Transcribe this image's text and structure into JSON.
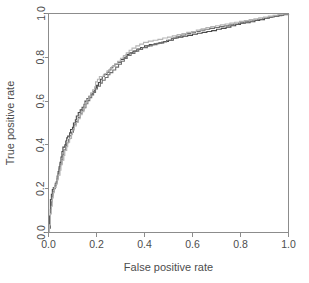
{
  "chart_data": {
    "type": "line",
    "title": "",
    "subtitle": "",
    "xlabel": "False positive rate",
    "ylabel": "True positive rate",
    "xlim": [
      0,
      1
    ],
    "ylim": [
      0,
      1
    ],
    "xticks": [
      "0.0",
      "0.2",
      "0.4",
      "0.6",
      "0.8",
      "1.0"
    ],
    "yticks": [
      "0.0",
      "0.2",
      "0.4",
      "0.6",
      "0.8",
      "1.0"
    ],
    "xtick_values": [
      0.0,
      0.2,
      0.4,
      0.6,
      0.8,
      1.0
    ],
    "ytick_values": [
      0.0,
      0.2,
      0.4,
      0.6,
      0.8,
      1.0
    ],
    "grid": false,
    "legend": "none",
    "legend_position": "none",
    "plot_style": "step",
    "colors": {
      "curve_dark": "#4a4a4a",
      "curve_medium": "#6e6e6e",
      "curve_light": "#b4b4b4",
      "axis": "#8c8c8c",
      "text": "#4d4d4d",
      "background": "#ffffff"
    },
    "series": [
      {
        "name": "curve-1",
        "color": "#4a4a4a",
        "points": [
          [
            0.0,
            0.0
          ],
          [
            0.004,
            0.03
          ],
          [
            0.004,
            0.075
          ],
          [
            0.008,
            0.11
          ],
          [
            0.008,
            0.15
          ],
          [
            0.012,
            0.175
          ],
          [
            0.016,
            0.196
          ],
          [
            0.02,
            0.205
          ],
          [
            0.028,
            0.215
          ],
          [
            0.032,
            0.232
          ],
          [
            0.036,
            0.258
          ],
          [
            0.04,
            0.278
          ],
          [
            0.044,
            0.3
          ],
          [
            0.048,
            0.32
          ],
          [
            0.052,
            0.345
          ],
          [
            0.056,
            0.37
          ],
          [
            0.06,
            0.39
          ],
          [
            0.068,
            0.4
          ],
          [
            0.072,
            0.418
          ],
          [
            0.076,
            0.432
          ],
          [
            0.08,
            0.44
          ],
          [
            0.088,
            0.455
          ],
          [
            0.092,
            0.47
          ],
          [
            0.1,
            0.48
          ],
          [
            0.104,
            0.5
          ],
          [
            0.112,
            0.515
          ],
          [
            0.116,
            0.532
          ],
          [
            0.124,
            0.548
          ],
          [
            0.132,
            0.56
          ],
          [
            0.14,
            0.572
          ],
          [
            0.148,
            0.585
          ],
          [
            0.152,
            0.6
          ],
          [
            0.16,
            0.612
          ],
          [
            0.168,
            0.622
          ],
          [
            0.176,
            0.632
          ],
          [
            0.184,
            0.645
          ],
          [
            0.192,
            0.66
          ],
          [
            0.2,
            0.672
          ],
          [
            0.208,
            0.685
          ],
          [
            0.216,
            0.7
          ],
          [
            0.224,
            0.712
          ],
          [
            0.232,
            0.722
          ],
          [
            0.244,
            0.732
          ],
          [
            0.252,
            0.742
          ],
          [
            0.26,
            0.752
          ],
          [
            0.268,
            0.76
          ],
          [
            0.276,
            0.768
          ],
          [
            0.288,
            0.778
          ],
          [
            0.3,
            0.79
          ],
          [
            0.312,
            0.8
          ],
          [
            0.324,
            0.812
          ],
          [
            0.336,
            0.82
          ],
          [
            0.352,
            0.828
          ],
          [
            0.368,
            0.838
          ],
          [
            0.384,
            0.845
          ],
          [
            0.4,
            0.852
          ],
          [
            0.42,
            0.858
          ],
          [
            0.44,
            0.862
          ],
          [
            0.46,
            0.866
          ],
          [
            0.48,
            0.872
          ],
          [
            0.5,
            0.878
          ],
          [
            0.52,
            0.888
          ],
          [
            0.54,
            0.892
          ],
          [
            0.56,
            0.896
          ],
          [
            0.58,
            0.9
          ],
          [
            0.6,
            0.905
          ],
          [
            0.62,
            0.91
          ],
          [
            0.64,
            0.914
          ],
          [
            0.66,
            0.918
          ],
          [
            0.68,
            0.922
          ],
          [
            0.7,
            0.928
          ],
          [
            0.72,
            0.932
          ],
          [
            0.74,
            0.938
          ],
          [
            0.76,
            0.944
          ],
          [
            0.78,
            0.95
          ],
          [
            0.8,
            0.956
          ],
          [
            0.82,
            0.958
          ],
          [
            0.84,
            0.962
          ],
          [
            0.86,
            0.968
          ],
          [
            0.88,
            0.972
          ],
          [
            0.9,
            0.978
          ],
          [
            0.92,
            0.984
          ],
          [
            0.94,
            0.988
          ],
          [
            0.96,
            0.992
          ],
          [
            0.98,
            0.996
          ],
          [
            1.0,
            1.0
          ]
        ]
      },
      {
        "name": "curve-2",
        "color": "#6e6e6e",
        "points": [
          [
            0.0,
            0.0
          ],
          [
            0.004,
            0.02
          ],
          [
            0.008,
            0.06
          ],
          [
            0.008,
            0.105
          ],
          [
            0.012,
            0.14
          ],
          [
            0.016,
            0.168
          ],
          [
            0.02,
            0.186
          ],
          [
            0.024,
            0.2
          ],
          [
            0.028,
            0.225
          ],
          [
            0.036,
            0.245
          ],
          [
            0.04,
            0.268
          ],
          [
            0.044,
            0.29
          ],
          [
            0.048,
            0.312
          ],
          [
            0.056,
            0.332
          ],
          [
            0.06,
            0.355
          ],
          [
            0.064,
            0.378
          ],
          [
            0.072,
            0.396
          ],
          [
            0.076,
            0.41
          ],
          [
            0.084,
            0.425
          ],
          [
            0.088,
            0.442
          ],
          [
            0.096,
            0.458
          ],
          [
            0.104,
            0.472
          ],
          [
            0.108,
            0.492
          ],
          [
            0.116,
            0.508
          ],
          [
            0.124,
            0.525
          ],
          [
            0.132,
            0.542
          ],
          [
            0.14,
            0.558
          ],
          [
            0.148,
            0.57
          ],
          [
            0.156,
            0.588
          ],
          [
            0.164,
            0.602
          ],
          [
            0.172,
            0.616
          ],
          [
            0.18,
            0.628
          ],
          [
            0.188,
            0.64
          ],
          [
            0.196,
            0.655
          ],
          [
            0.204,
            0.668
          ],
          [
            0.216,
            0.682
          ],
          [
            0.224,
            0.695
          ],
          [
            0.236,
            0.708
          ],
          [
            0.248,
            0.72
          ],
          [
            0.256,
            0.73
          ],
          [
            0.268,
            0.742
          ],
          [
            0.28,
            0.755
          ],
          [
            0.292,
            0.768
          ],
          [
            0.304,
            0.782
          ],
          [
            0.316,
            0.795
          ],
          [
            0.328,
            0.808
          ],
          [
            0.344,
            0.818
          ],
          [
            0.36,
            0.828
          ],
          [
            0.376,
            0.836
          ],
          [
            0.392,
            0.844
          ],
          [
            0.412,
            0.852
          ],
          [
            0.432,
            0.858
          ],
          [
            0.452,
            0.864
          ],
          [
            0.472,
            0.87
          ],
          [
            0.492,
            0.878
          ],
          [
            0.512,
            0.886
          ],
          [
            0.532,
            0.896
          ],
          [
            0.552,
            0.902
          ],
          [
            0.572,
            0.908
          ],
          [
            0.592,
            0.912
          ],
          [
            0.612,
            0.918
          ],
          [
            0.632,
            0.924
          ],
          [
            0.652,
            0.928
          ],
          [
            0.672,
            0.932
          ],
          [
            0.692,
            0.936
          ],
          [
            0.712,
            0.94
          ],
          [
            0.732,
            0.944
          ],
          [
            0.752,
            0.948
          ],
          [
            0.772,
            0.952
          ],
          [
            0.792,
            0.956
          ],
          [
            0.812,
            0.962
          ],
          [
            0.832,
            0.966
          ],
          [
            0.852,
            0.97
          ],
          [
            0.872,
            0.974
          ],
          [
            0.892,
            0.978
          ],
          [
            0.912,
            0.982
          ],
          [
            0.932,
            0.986
          ],
          [
            0.952,
            0.99
          ],
          [
            0.972,
            0.994
          ],
          [
            1.0,
            1.0
          ]
        ]
      },
      {
        "name": "curve-3",
        "color": "#b4b4b4",
        "points": [
          [
            0.0,
            0.0
          ],
          [
            0.004,
            0.035
          ],
          [
            0.008,
            0.085
          ],
          [
            0.012,
            0.12
          ],
          [
            0.016,
            0.158
          ],
          [
            0.02,
            0.182
          ],
          [
            0.024,
            0.206
          ],
          [
            0.032,
            0.22
          ],
          [
            0.036,
            0.24
          ],
          [
            0.04,
            0.262
          ],
          [
            0.048,
            0.285
          ],
          [
            0.052,
            0.308
          ],
          [
            0.056,
            0.33
          ],
          [
            0.064,
            0.352
          ],
          [
            0.068,
            0.375
          ],
          [
            0.076,
            0.392
          ],
          [
            0.08,
            0.412
          ],
          [
            0.088,
            0.43
          ],
          [
            0.096,
            0.448
          ],
          [
            0.1,
            0.468
          ],
          [
            0.108,
            0.486
          ],
          [
            0.116,
            0.502
          ],
          [
            0.124,
            0.52
          ],
          [
            0.132,
            0.538
          ],
          [
            0.14,
            0.552
          ],
          [
            0.148,
            0.568
          ],
          [
            0.152,
            0.592
          ],
          [
            0.16,
            0.608
          ],
          [
            0.168,
            0.62
          ],
          [
            0.176,
            0.638
          ],
          [
            0.184,
            0.652
          ],
          [
            0.192,
            0.665
          ],
          [
            0.196,
            0.688
          ],
          [
            0.204,
            0.7
          ],
          [
            0.212,
            0.712
          ],
          [
            0.228,
            0.718
          ],
          [
            0.236,
            0.726
          ],
          [
            0.244,
            0.738
          ],
          [
            0.256,
            0.748
          ],
          [
            0.264,
            0.758
          ],
          [
            0.276,
            0.77
          ],
          [
            0.288,
            0.782
          ],
          [
            0.3,
            0.796
          ],
          [
            0.312,
            0.808
          ],
          [
            0.324,
            0.82
          ],
          [
            0.336,
            0.832
          ],
          [
            0.348,
            0.842
          ],
          [
            0.364,
            0.852
          ],
          [
            0.38,
            0.86
          ],
          [
            0.396,
            0.868
          ],
          [
            0.416,
            0.874
          ],
          [
            0.436,
            0.878
          ],
          [
            0.456,
            0.882
          ],
          [
            0.476,
            0.888
          ],
          [
            0.496,
            0.892
          ],
          [
            0.516,
            0.898
          ],
          [
            0.536,
            0.904
          ],
          [
            0.556,
            0.908
          ],
          [
            0.576,
            0.914
          ],
          [
            0.596,
            0.918
          ],
          [
            0.616,
            0.924
          ],
          [
            0.636,
            0.93
          ],
          [
            0.656,
            0.936
          ],
          [
            0.676,
            0.94
          ],
          [
            0.696,
            0.944
          ],
          [
            0.716,
            0.948
          ],
          [
            0.736,
            0.952
          ],
          [
            0.756,
            0.956
          ],
          [
            0.776,
            0.96
          ],
          [
            0.796,
            0.964
          ],
          [
            0.816,
            0.968
          ],
          [
            0.836,
            0.972
          ],
          [
            0.856,
            0.976
          ],
          [
            0.876,
            0.98
          ],
          [
            0.896,
            0.984
          ],
          [
            0.916,
            0.988
          ],
          [
            0.936,
            0.992
          ],
          [
            0.956,
            0.996
          ],
          [
            0.976,
            0.998
          ],
          [
            1.0,
            1.0
          ]
        ]
      }
    ]
  }
}
